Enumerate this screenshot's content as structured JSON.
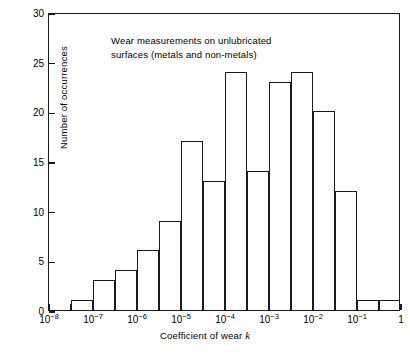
{
  "chart_data": {
    "type": "bar",
    "title": "Wear measurements on unlubricated\nsurfaces (metals and non-metals)",
    "xlabel_prefix": "Coefficient of wear ",
    "xlabel_variable": "k",
    "ylabel": "Number of occurrences",
    "xscale": "log",
    "xlim": [
      1e-08,
      1
    ],
    "ylim": [
      0,
      30
    ],
    "grid": false,
    "legend": "none",
    "bin_edges": [
      1e-08,
      3.162e-08,
      1e-07,
      3.162e-07,
      1e-06,
      3.162e-06,
      1e-05,
      3.162e-05,
      0.0001,
      0.0003162,
      0.001,
      0.003162,
      0.01,
      0.03162,
      0.1,
      0.3162,
      1
    ],
    "categories": [
      "1e-8 to 3.16e-8",
      "3.16e-8 to 1e-7",
      "1e-7 to 3.16e-7",
      "3.16e-7 to 1e-6",
      "1e-6 to 3.16e-6",
      "3.16e-6 to 1e-5",
      "1e-5 to 3.16e-5",
      "3.16e-5 to 1e-4",
      "1e-4 to 3.16e-4",
      "3.16e-4 to 1e-3",
      "1e-3 to 3.16e-3",
      "3.16e-3 to 1e-2",
      "1e-2 to 3.16e-2",
      "3.16e-2 to 1e-1",
      "1e-1 to 3.16e-1",
      "3.16e-1 to 1"
    ],
    "values": [
      0,
      1,
      3,
      4,
      6,
      9,
      17,
      13,
      24,
      14,
      23,
      24,
      20,
      12,
      1,
      1
    ],
    "y_ticks": [
      0,
      5,
      10,
      15,
      20,
      25,
      30
    ],
    "y_tick_labels": [
      "0",
      "5",
      "10",
      "15",
      "20",
      "25",
      "30"
    ],
    "x_major_ticks": [
      {
        "value": 1e-08,
        "mantissa": "10",
        "exponent": "-8"
      },
      {
        "value": 1e-07,
        "mantissa": "10",
        "exponent": "-7"
      },
      {
        "value": 1e-06,
        "mantissa": "10",
        "exponent": "-6"
      },
      {
        "value": 1e-05,
        "mantissa": "10",
        "exponent": "-5"
      },
      {
        "value": 0.0001,
        "mantissa": "10",
        "exponent": "-4"
      },
      {
        "value": 0.001,
        "mantissa": "10",
        "exponent": "-3"
      },
      {
        "value": 0.01,
        "mantissa": "10",
        "exponent": "-2"
      },
      {
        "value": 0.1,
        "mantissa": "10",
        "exponent": "-1"
      },
      {
        "value": 1,
        "mantissa": "1",
        "exponent": ""
      }
    ],
    "x_minor_ticks": [
      3.162e-08,
      3.162e-07,
      3.162e-06,
      3.162e-05,
      0.0003162,
      0.003162,
      0.03162,
      0.3162
    ],
    "colors": {
      "axis": "#1a1a1a",
      "bar_stroke": "#1a1a1a",
      "bar_fill": "none",
      "background": "#ffffff",
      "text": "#000000"
    }
  }
}
